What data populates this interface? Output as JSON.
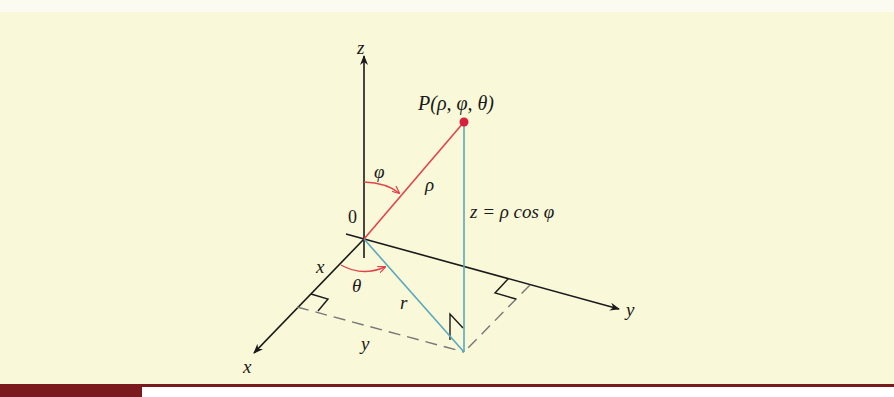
{
  "figure": {
    "background_color": "#f9f8d8",
    "accent_color": "#7a1a1c",
    "axes": {
      "z_label": "z",
      "y_label": "y",
      "x_label": "x",
      "origin_label": "0"
    },
    "point_label": "P(ρ, φ, θ)",
    "segment_labels": {
      "rho": "ρ",
      "phi": "φ",
      "theta": "θ",
      "r": "r",
      "x": "x",
      "y": "y",
      "z_formula": "z = ρ cos φ"
    },
    "colors": {
      "rho_line": "#e0444c",
      "projection_lines": "#5aa8bd",
      "axes": "#1a1a1a",
      "point": "#d91f3e"
    }
  },
  "caption": {
    "tag": "",
    "text": ""
  }
}
